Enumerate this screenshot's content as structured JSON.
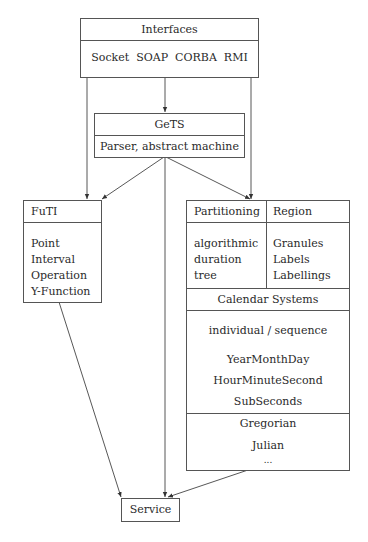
{
  "interfaces": {
    "title": "Interfaces",
    "items": [
      "Socket",
      "SOAP",
      "CORBA",
      "RMI"
    ]
  },
  "gets": {
    "title": "GeTS",
    "subtitle": "Parser, abstract machine"
  },
  "futi": {
    "title": "FuTI",
    "items": [
      "Point",
      "Interval",
      "Operation",
      "Y-Function"
    ]
  },
  "calendar_box": {
    "partitioning": {
      "title": "Partitioning",
      "items": [
        "algorithmic",
        "duration",
        "tree"
      ]
    },
    "region": {
      "title": "Region",
      "items": [
        "Granules",
        "Labels",
        "Labellings"
      ]
    },
    "calendar_systems": {
      "title": "Calendar Systems",
      "mode": "individual / sequence",
      "items": [
        "YearMonthDay",
        "HourMinuteSecond",
        "SubSeconds"
      ]
    },
    "calendars": [
      "Gregorian",
      "Julian",
      "..."
    ]
  },
  "service": {
    "title": "Service"
  },
  "edges": [
    {
      "from": "Interfaces",
      "to": "GeTS"
    },
    {
      "from": "Interfaces",
      "to": "FuTI"
    },
    {
      "from": "Interfaces",
      "to": "Partitioning/Region"
    },
    {
      "from": "GeTS",
      "to": "FuTI"
    },
    {
      "from": "GeTS",
      "to": "Partitioning/Region"
    },
    {
      "from": "GeTS",
      "to": "Service"
    },
    {
      "from": "FuTI",
      "to": "Service"
    },
    {
      "from": "Partitioning/Region",
      "to": "Service"
    }
  ]
}
